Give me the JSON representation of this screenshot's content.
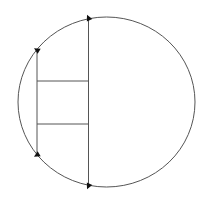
{
  "diagram": {
    "background": "#ffffff",
    "stroke_color": "#555555",
    "arrow_color": "#111111",
    "circle": {
      "cx": 106.5,
      "cy": 102,
      "rx": 88.5,
      "ry": 85
    },
    "chords": [
      {
        "name": "right-vertical-chord",
        "x1": 88.5,
        "y1": 18,
        "x2": 88.5,
        "y2": 186
      },
      {
        "name": "left-vertical-chord",
        "x1": 37,
        "y1": 50,
        "x2": 37,
        "y2": 155
      }
    ],
    "rungs": [
      {
        "name": "upper-horizontal-segment",
        "x1": 37,
        "y1": 81,
        "x2": 88.5,
        "y2": 81
      },
      {
        "name": "lower-horizontal-segment",
        "x1": 37,
        "y1": 124,
        "x2": 88.5,
        "y2": 124
      }
    ],
    "arrowheads": [
      {
        "name": "arrow-top-right",
        "x": 88.5,
        "y": 18,
        "angle": -25
      },
      {
        "name": "arrow-top-left",
        "x": 37,
        "y": 50,
        "angle": -60
      },
      {
        "name": "arrow-bottom-left",
        "x": 37,
        "y": 155,
        "angle": 60
      },
      {
        "name": "arrow-bottom-right",
        "x": 88.5,
        "y": 186,
        "angle": 25
      }
    ]
  }
}
